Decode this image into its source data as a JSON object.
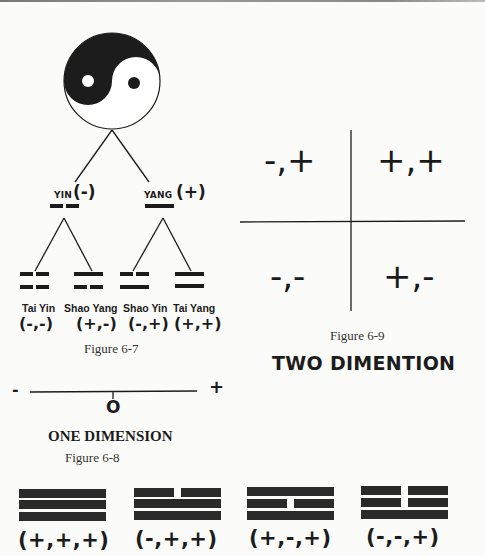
{
  "figure_6_7": {
    "caption": "Figure 6-7",
    "root": {
      "icon": "yin-yang-icon"
    },
    "level1": [
      {
        "name": "YIN",
        "sign": "(-)",
        "line": "broken"
      },
      {
        "name": "YANG",
        "sign": "(+)",
        "line": "solid"
      }
    ],
    "level2": [
      {
        "name": "Tai Yin",
        "tuple": "(-,-)",
        "lines": [
          "broken",
          "broken"
        ]
      },
      {
        "name": "Shao Yang",
        "tuple": "(+,-)",
        "lines": [
          "solid",
          "broken"
        ]
      },
      {
        "name": "Shao Yin",
        "tuple": "(-,+)",
        "lines": [
          "broken",
          "solid"
        ]
      },
      {
        "name": "Tai Yang",
        "tuple": "(+,+)",
        "lines": [
          "solid",
          "solid"
        ]
      }
    ]
  },
  "figure_6_9": {
    "caption": "Figure 6-9",
    "title": "TWO DIMENTION",
    "quadrants": {
      "top_left": "-,+",
      "top_right": "+,+",
      "bottom_left": "-,-",
      "bottom_right": "+,-"
    }
  },
  "figure_6_8": {
    "caption": "Figure 6-8",
    "title": "ONE DIMENSION",
    "negative_end": "-",
    "positive_end": "+",
    "origin": "O"
  },
  "trigrams": [
    {
      "tuple": "(+,+,+)",
      "lines_top_to_bottom": [
        "solid",
        "solid",
        "solid"
      ]
    },
    {
      "tuple": "(-,+,+)",
      "lines_top_to_bottom": [
        "broken",
        "solid",
        "solid"
      ]
    },
    {
      "tuple": "(+,-,+)",
      "lines_top_to_bottom": [
        "solid",
        "broken",
        "solid"
      ]
    },
    {
      "tuple": "(-,-,+)",
      "lines_top_to_bottom": [
        "broken",
        "broken",
        "solid"
      ]
    }
  ],
  "colors": {
    "ink": "#1c1c1c",
    "paper": "#fbfbf9"
  }
}
